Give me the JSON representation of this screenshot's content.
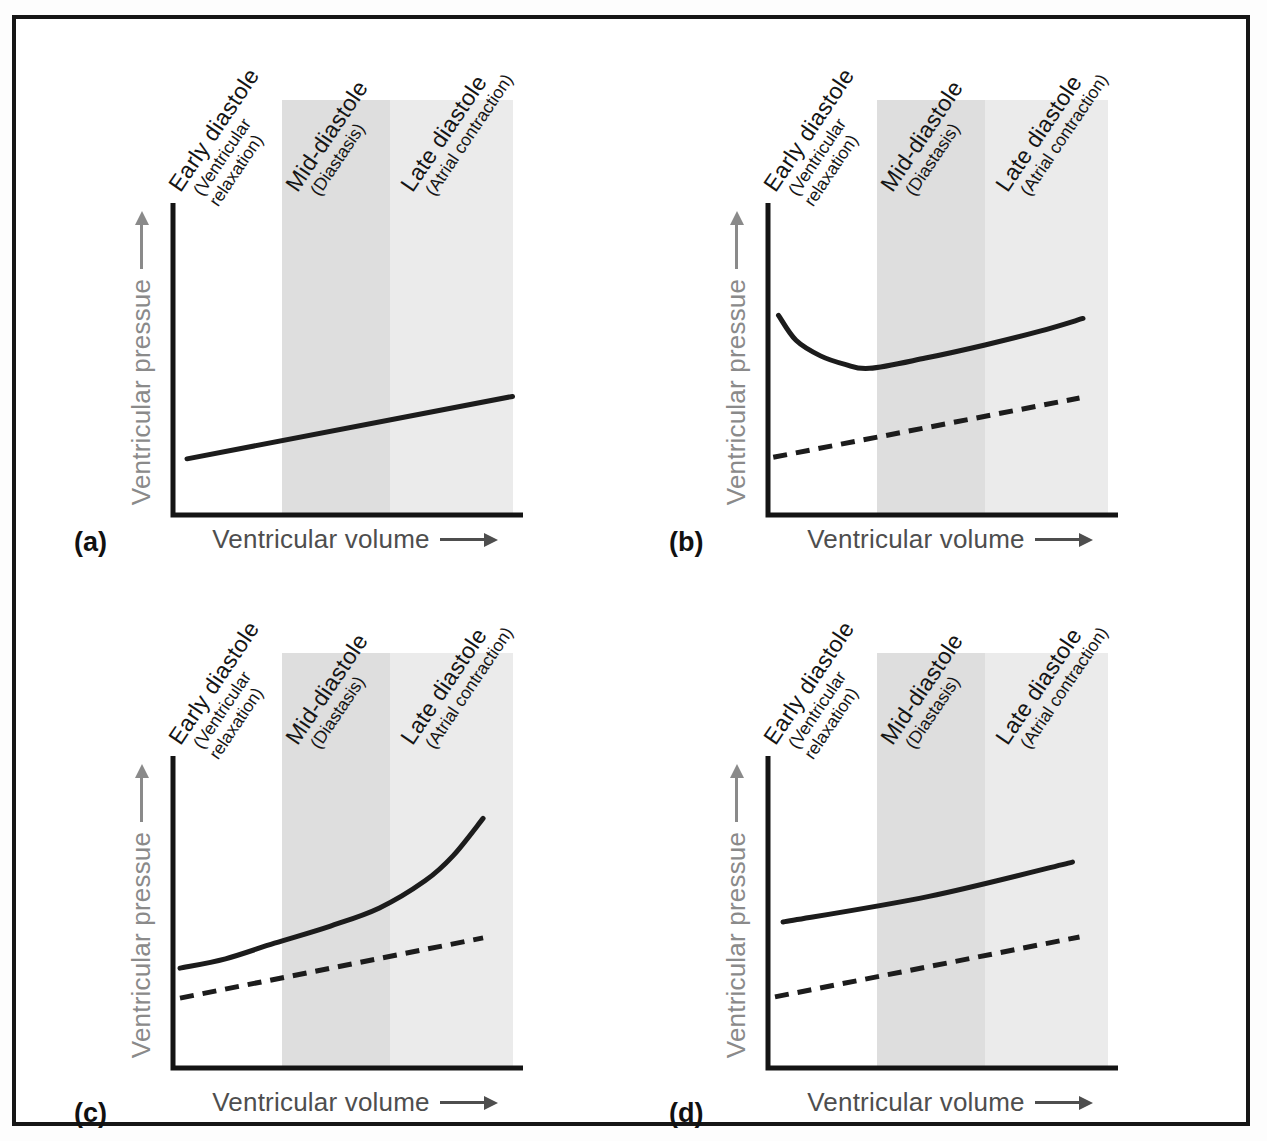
{
  "figure": {
    "colors": {
      "frame_border": "#161616",
      "curve": "#1c1c1c",
      "axis": "#141414",
      "x_label_text": "#4e4e4e",
      "y_label_text": "#8a8a8a",
      "band_mid": "#dedede",
      "band_late": "#ebebeb",
      "background": "#ffffff"
    }
  },
  "chart_data": {
    "type": "line",
    "title": "",
    "axes": {
      "x_label": "Ventricular volume",
      "y_label": "Ventricular pressue",
      "x_ticks": [],
      "y_ticks": [],
      "x_range_normalized": [
        0,
        1
      ],
      "y_range_normalized": [
        0,
        1
      ],
      "axis_arrows": true
    },
    "layout_hints": {
      "grid": false,
      "legend": "none",
      "qualitative": true,
      "band_shading": "mid-diastole darker gray, late diastole lighter gray, early diastole white"
    },
    "phase_labels": [
      {
        "title": "Early diastole",
        "sub_lines": [
          "(Ventricular",
          "relaxation)"
        ]
      },
      {
        "title": "Mid-diastole",
        "sub_lines": [
          "(Diastasis)"
        ]
      },
      {
        "title": "Late diastole",
        "sub_lines": [
          "(Atrial contraction)"
        ]
      }
    ],
    "bands": [
      {
        "phase": "early-diastole",
        "x_span": [
          0.0,
          0.31
        ],
        "color": "#ffffff"
      },
      {
        "phase": "mid-diastole",
        "x_span": [
          0.31,
          0.62
        ],
        "color": "#dedede"
      },
      {
        "phase": "late-diastole",
        "x_span": [
          0.62,
          0.97
        ],
        "color": "#ebebeb"
      }
    ],
    "panels": [
      {
        "label": "(a)",
        "series": [
          {
            "name": "pressure-curve",
            "style": "solid",
            "points": [
              [
                0.04,
                0.18
              ],
              [
                0.97,
                0.38
              ]
            ]
          }
        ]
      },
      {
        "label": "(b)",
        "series": [
          {
            "name": "pressure-curve",
            "style": "solid",
            "points": [
              [
                0.03,
                0.64
              ],
              [
                0.08,
                0.56
              ],
              [
                0.15,
                0.51
              ],
              [
                0.22,
                0.483
              ],
              [
                0.29,
                0.47
              ],
              [
                0.45,
                0.503
              ],
              [
                0.62,
                0.545
              ],
              [
                0.78,
                0.59
              ],
              [
                0.9,
                0.63
              ]
            ]
          },
          {
            "name": "reference-curve",
            "style": "dashed",
            "points": [
              [
                0.015,
                0.185
              ],
              [
                0.89,
                0.375
              ]
            ]
          }
        ]
      },
      {
        "label": "(c)",
        "series": [
          {
            "name": "pressure-curve",
            "style": "solid",
            "points": [
              [
                0.02,
                0.32
              ],
              [
                0.15,
                0.35
              ],
              [
                0.29,
                0.4
              ],
              [
                0.45,
                0.455
              ],
              [
                0.59,
                0.513
              ],
              [
                0.72,
                0.6
              ],
              [
                0.8,
                0.68
              ],
              [
                0.886,
                0.8
              ]
            ]
          },
          {
            "name": "reference-curve",
            "style": "dashed",
            "points": [
              [
                0.02,
                0.224
              ],
              [
                0.886,
                0.417
              ]
            ]
          }
        ]
      },
      {
        "label": "(d)",
        "series": [
          {
            "name": "pressure-curve",
            "style": "solid",
            "points": [
              [
                0.043,
                0.468
              ],
              [
                0.46,
                0.55
              ],
              [
                0.87,
                0.66
              ]
            ]
          },
          {
            "name": "reference-curve",
            "style": "dashed",
            "points": [
              [
                0.02,
                0.228
              ],
              [
                0.89,
                0.42
              ]
            ]
          }
        ]
      }
    ]
  }
}
